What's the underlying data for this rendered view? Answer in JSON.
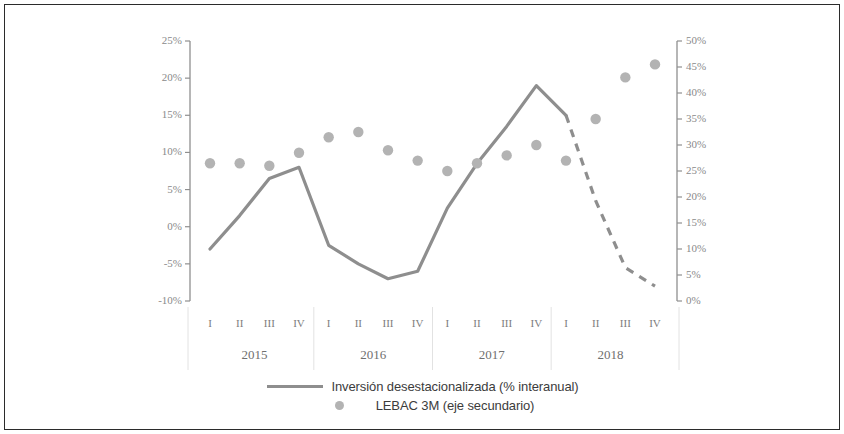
{
  "chart_data": {
    "type": "line",
    "title": "",
    "xlabel": "",
    "categories": [
      "I",
      "II",
      "III",
      "IV",
      "I",
      "II",
      "III",
      "IV",
      "I",
      "II",
      "III",
      "IV",
      "I",
      "II",
      "III",
      "IV"
    ],
    "year_groups": [
      {
        "year": "2015",
        "quarters": [
          "I",
          "II",
          "III",
          "IV"
        ]
      },
      {
        "year": "2016",
        "quarters": [
          "I",
          "II",
          "III",
          "IV"
        ]
      },
      {
        "year": "2017",
        "quarters": [
          "I",
          "II",
          "III",
          "IV"
        ]
      },
      {
        "year": "2018",
        "quarters": [
          "I",
          "II",
          "III",
          "IV"
        ]
      }
    ],
    "grid": false,
    "legend_position": "bottom",
    "axes": {
      "left": {
        "label": "",
        "ylim": [
          -10,
          25
        ],
        "step": 5,
        "ticks": [
          "25%",
          "20%",
          "15%",
          "10%",
          "5%",
          "0%",
          "-5%",
          "-10%"
        ],
        "tick_values": [
          25,
          20,
          15,
          10,
          5,
          0,
          -5,
          -10
        ]
      },
      "right": {
        "label": "",
        "ylim": [
          0,
          50
        ],
        "step": 5,
        "ticks": [
          "50%",
          "45%",
          "40%",
          "35%",
          "30%",
          "25%",
          "20%",
          "15%",
          "10%",
          "5%",
          "0%"
        ],
        "tick_values": [
          50,
          45,
          40,
          35,
          30,
          25,
          20,
          15,
          10,
          5,
          0
        ]
      }
    },
    "series": [
      {
        "name": "Inversión desestacionalizada (% interanual)",
        "type": "line",
        "axis": "left",
        "color": "#8e8e8e",
        "values": [
          -3,
          1.5,
          6.5,
          8,
          -2.5,
          -5,
          -7,
          -6,
          2.5,
          8.5,
          13.5,
          19,
          15,
          3.5,
          -5.5,
          -8
        ],
        "solid_through_index": 12,
        "dashed_from_index": 12,
        "dashed_note": "projection"
      },
      {
        "name": "LEBAC 3M (eje secundario)",
        "type": "scatter",
        "axis": "right",
        "color": "#b3b3b3",
        "values": [
          26.5,
          26.5,
          26,
          28.5,
          31.5,
          32.5,
          29,
          27,
          25,
          26.5,
          28,
          30,
          27,
          35,
          43,
          45.5
        ]
      }
    ]
  },
  "legend": {
    "entries": [
      {
        "label": "Inversión desestacionalizada (% interanual)",
        "marker": "line"
      },
      {
        "label": "LEBAC 3M (eje secundario)",
        "marker": "dot"
      }
    ]
  },
  "colors": {
    "line": "#8e8e8e",
    "dot": "#b3b3b3",
    "axis": "#8f8f8f",
    "text": "#7d7d7d",
    "border": "#2b2b2b"
  }
}
